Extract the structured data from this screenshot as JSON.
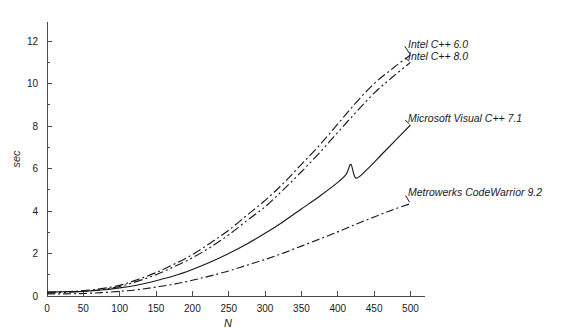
{
  "chart_data": {
    "type": "line",
    "title": "",
    "subtitle": "",
    "xlabel": "N",
    "ylabel": "sec",
    "xlim": [
      0,
      520
    ],
    "ylim": [
      0,
      12.9
    ],
    "grid": false,
    "legend_position": "inline-right-annotations",
    "x_ticks": [
      0,
      50,
      100,
      150,
      200,
      250,
      300,
      350,
      400,
      450,
      500
    ],
    "x_tick_labels": [
      "0",
      "50",
      "100",
      "150",
      "200",
      "250",
      "300",
      "350",
      "400",
      "450",
      "500"
    ],
    "y_ticks": [
      0,
      2,
      4,
      6,
      8,
      10,
      12
    ],
    "y_tick_labels": [
      "0",
      "2",
      "4",
      "6",
      "8",
      "10",
      "12"
    ],
    "y_minor_ticks": [
      1,
      3,
      5,
      7,
      9,
      11
    ],
    "line_color": "#1a1a1a",
    "axis_color": "#4a4a4a",
    "background_color": "#ffffff",
    "series": [
      {
        "name": "Intel C++ 6.0",
        "label": "Intel C++ 6.0",
        "dash": "9,3,2,3",
        "label_x": 408,
        "label_y": 48,
        "x": [
          0,
          25,
          50,
          75,
          100,
          125,
          150,
          175,
          200,
          225,
          250,
          275,
          300,
          325,
          350,
          375,
          400,
          425,
          450,
          475,
          500
        ],
        "values": [
          0.18,
          0.2,
          0.25,
          0.35,
          0.5,
          0.78,
          1.1,
          1.5,
          1.95,
          2.5,
          3.1,
          3.8,
          4.5,
          5.3,
          6.2,
          7.1,
          8.1,
          9.1,
          10.0,
          10.7,
          11.35
        ]
      },
      {
        "name": "Intel C++ 8.0",
        "label": "Intel C++ 8.0",
        "dash": "9,3,2,3,2,3",
        "label_x": 408,
        "label_y": 60,
        "x": [
          0,
          25,
          50,
          75,
          100,
          125,
          150,
          175,
          200,
          225,
          250,
          275,
          300,
          325,
          350,
          375,
          400,
          425,
          450,
          475,
          500
        ],
        "values": [
          0.15,
          0.17,
          0.22,
          0.3,
          0.45,
          0.7,
          1.0,
          1.38,
          1.8,
          2.3,
          2.88,
          3.55,
          4.2,
          5.0,
          5.85,
          6.75,
          7.7,
          8.65,
          9.55,
          10.3,
          11.0
        ]
      },
      {
        "name": "Microsoft Visual C++ 7.1",
        "label": "Microsoft Visual C++ 7.1",
        "dash": "none",
        "label_x": 408,
        "label_y": 122,
        "x": [
          0,
          25,
          50,
          75,
          100,
          125,
          150,
          175,
          200,
          225,
          250,
          275,
          300,
          325,
          350,
          375,
          400,
          412,
          418,
          425,
          440,
          460,
          480,
          500
        ],
        "values": [
          0.18,
          0.2,
          0.22,
          0.28,
          0.38,
          0.52,
          0.72,
          0.95,
          1.25,
          1.6,
          2.0,
          2.45,
          2.95,
          3.5,
          4.1,
          4.7,
          5.35,
          5.75,
          6.2,
          5.55,
          5.95,
          6.65,
          7.35,
          8.05
        ]
      },
      {
        "name": "Metrowerks CodeWarrior 9.2",
        "label": "Metrowerks CodeWarrior 9.2",
        "dash": "8,3,2,3",
        "label_x": 408,
        "label_y": 196,
        "x": [
          0,
          25,
          50,
          75,
          100,
          125,
          150,
          175,
          200,
          225,
          250,
          275,
          300,
          325,
          350,
          375,
          400,
          425,
          450,
          475,
          500
        ],
        "values": [
          0.1,
          0.1,
          0.12,
          0.16,
          0.22,
          0.3,
          0.42,
          0.56,
          0.74,
          0.95,
          1.18,
          1.45,
          1.72,
          2.02,
          2.35,
          2.68,
          3.02,
          3.38,
          3.72,
          4.05,
          4.35
        ]
      }
    ]
  }
}
